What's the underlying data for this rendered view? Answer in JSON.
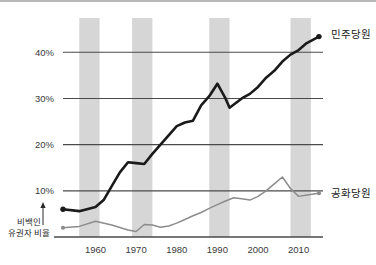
{
  "chart_data": {
    "type": "line",
    "title": "",
    "xlabel": "",
    "ylabel": "비백인 유권자 비율",
    "ylabel_lines": [
      "비백인",
      "유권자 비율"
    ],
    "xlim": [
      1952,
      2016
    ],
    "ylim": [
      0,
      47
    ],
    "grid": true,
    "gridlines_y": [
      10,
      20,
      30,
      40
    ],
    "ytick_labels": [
      "10%",
      "20%",
      "30%",
      "40%"
    ],
    "ytick_values": [
      10,
      20,
      30,
      40
    ],
    "xtick_labels": [
      "1960",
      "1970",
      "1980",
      "1990",
      "2000",
      "2010"
    ],
    "xtick_values": [
      1960,
      1970,
      1980,
      1990,
      2000,
      2010
    ],
    "legend_position": "right-inline",
    "shaded_bands": [
      {
        "x0": 1956,
        "x1": 1961
      },
      {
        "x0": 1969,
        "x1": 1974
      },
      {
        "x0": 1988,
        "x1": 1993
      },
      {
        "x0": 2008,
        "x1": 2013
      }
    ],
    "series": [
      {
        "name": "민주당원",
        "color": "#1a1a1a",
        "width": 2.6,
        "label_x": 2017,
        "label_y": 44,
        "points": [
          [
            1952,
            6.0
          ],
          [
            1956,
            5.6
          ],
          [
            1960,
            6.5
          ],
          [
            1962,
            8.0
          ],
          [
            1964,
            11.0
          ],
          [
            1966,
            14.0
          ],
          [
            1968,
            16.2
          ],
          [
            1970,
            16.0
          ],
          [
            1972,
            15.8
          ],
          [
            1974,
            18.0
          ],
          [
            1976,
            20.0
          ],
          [
            1978,
            22.0
          ],
          [
            1980,
            24.0
          ],
          [
            1982,
            24.8
          ],
          [
            1984,
            25.2
          ],
          [
            1986,
            28.5
          ],
          [
            1988,
            30.5
          ],
          [
            1990,
            33.2
          ],
          [
            1992,
            30.0
          ],
          [
            1993,
            28.0
          ],
          [
            1996,
            30.0
          ],
          [
            1998,
            31.0
          ],
          [
            2000,
            32.5
          ],
          [
            2002,
            34.5
          ],
          [
            2004,
            36.0
          ],
          [
            2006,
            38.0
          ],
          [
            2008,
            39.5
          ],
          [
            2010,
            40.5
          ],
          [
            2012,
            42.0
          ],
          [
            2015,
            43.4
          ]
        ],
        "markers": [
          [
            1952,
            6.0
          ],
          [
            2015,
            43.4
          ]
        ]
      },
      {
        "name": "공화당원",
        "color": "#8c8c8c",
        "width": 1.5,
        "label_x": 2017,
        "label_y": 9.5,
        "points": [
          [
            1952,
            2.0
          ],
          [
            1956,
            2.3
          ],
          [
            1960,
            3.4
          ],
          [
            1964,
            2.6
          ],
          [
            1968,
            1.5
          ],
          [
            1970,
            1.2
          ],
          [
            1972,
            2.7
          ],
          [
            1974,
            2.6
          ],
          [
            1976,
            2.1
          ],
          [
            1978,
            2.4
          ],
          [
            1980,
            3.0
          ],
          [
            1982,
            3.8
          ],
          [
            1984,
            4.6
          ],
          [
            1986,
            5.3
          ],
          [
            1988,
            6.2
          ],
          [
            1990,
            7.0
          ],
          [
            1992,
            7.8
          ],
          [
            1994,
            8.5
          ],
          [
            1996,
            8.3
          ],
          [
            1998,
            8.0
          ],
          [
            2000,
            8.8
          ],
          [
            2002,
            10.0
          ],
          [
            2004,
            11.5
          ],
          [
            2006,
            13.0
          ],
          [
            2008,
            10.5
          ],
          [
            2010,
            8.8
          ],
          [
            2012,
            9.1
          ],
          [
            2015,
            9.5
          ]
        ],
        "markers": [
          [
            1952,
            2.0
          ],
          [
            2015,
            9.5
          ]
        ]
      }
    ]
  },
  "annotations": {
    "arrow_icon": "up-arrow-icon"
  }
}
